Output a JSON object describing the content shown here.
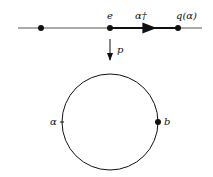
{
  "diagram": {
    "top_line": {
      "labels": {
        "identity": "e",
        "lift": "α†",
        "endpoint": "q(α)"
      }
    },
    "projection": {
      "label": "p"
    },
    "circle": {
      "labels": {
        "loop": "α",
        "basepoint": "b"
      }
    },
    "colors": {
      "stroke": "#111111",
      "line": "#555555"
    }
  }
}
